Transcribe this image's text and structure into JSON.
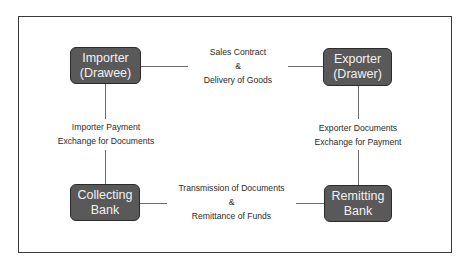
{
  "diagram": {
    "nodes": {
      "importer": {
        "line1": "Importer",
        "line2": "(Drawee)"
      },
      "exporter": {
        "line1": "Exporter",
        "line2": "(Drawer)"
      },
      "collecting_bank": {
        "line1": "Collecting",
        "line2": "Bank"
      },
      "remitting_bank": {
        "line1": "Remitting",
        "line2": "Bank"
      }
    },
    "edges": {
      "top": {
        "line1": "Sales Contract",
        "line2": "&",
        "line3": "Delivery of Goods",
        "from": "importer",
        "to": "exporter"
      },
      "left": {
        "line1": "Importer Payment",
        "line2": "Exchange for Documents",
        "from": "importer",
        "to": "collecting_bank"
      },
      "right": {
        "line1": "Exporter Documents",
        "line2": "Exchange for Payment",
        "from": "exporter",
        "to": "remitting_bank"
      },
      "bottom": {
        "line1": "Transmission of Documents",
        "line2": "&",
        "line3": "Remittance of Funds",
        "from": "collecting_bank",
        "to": "remitting_bank"
      }
    },
    "colors": {
      "node_fill": "#595959",
      "node_border": "#2b2b2b",
      "node_text": "#f2f2f2",
      "connector": "#6e6e6e",
      "frame_border": "#3a3a3a",
      "label_text": "#2a2a2a"
    }
  }
}
